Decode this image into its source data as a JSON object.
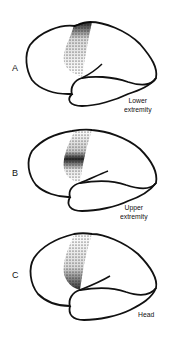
{
  "figure": {
    "panels": [
      {
        "letter": "A",
        "caption_line1": "Lower",
        "caption_line2": "extremity",
        "highlight": "top"
      },
      {
        "letter": "B",
        "caption_line1": "Upper",
        "caption_line2": "extremity",
        "highlight": "middle"
      },
      {
        "letter": "C",
        "caption_line1": "Head",
        "caption_line2": "",
        "highlight": "bottom"
      }
    ],
    "colors": {
      "outline": "#111111",
      "stipple": "#111111",
      "background": "#ffffff"
    }
  }
}
